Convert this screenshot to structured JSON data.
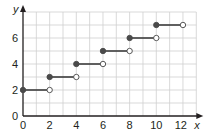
{
  "chart_data": {
    "type": "line",
    "subtype": "step-function",
    "title": "",
    "xlabel": "x",
    "ylabel": "y",
    "xlim": [
      0,
      13
    ],
    "ylim": [
      0,
      8
    ],
    "grid": true,
    "grid_spacing": {
      "x": 1,
      "y": 1
    },
    "x_ticks": [
      0,
      2,
      4,
      6,
      8,
      10,
      12
    ],
    "y_ticks": [
      0,
      2,
      4,
      6
    ],
    "segments": [
      {
        "x_start": 0,
        "x_end": 2,
        "y": 2,
        "start_closed": true,
        "end_closed": false
      },
      {
        "x_start": 2,
        "x_end": 4,
        "y": 3,
        "start_closed": true,
        "end_closed": false
      },
      {
        "x_start": 4,
        "x_end": 6,
        "y": 4,
        "start_closed": true,
        "end_closed": false
      },
      {
        "x_start": 6,
        "x_end": 8,
        "y": 5,
        "start_closed": true,
        "end_closed": false
      },
      {
        "x_start": 8,
        "x_end": 10,
        "y": 6,
        "start_closed": true,
        "end_closed": false
      },
      {
        "x_start": 10,
        "x_end": 12,
        "y": 7,
        "start_closed": true,
        "end_closed": false
      }
    ],
    "colors": {
      "line": "#3d3d3d",
      "grid": "#cfcfcf",
      "axis": "#231f20",
      "closed_dot": "#4a4a4a",
      "open_dot_fill": "#ffffff"
    }
  }
}
